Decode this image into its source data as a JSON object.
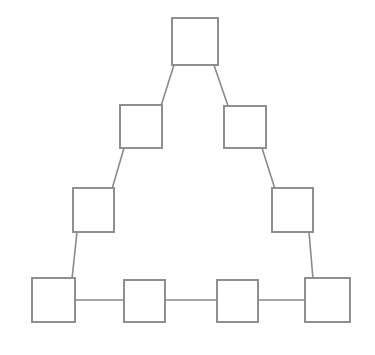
{
  "diagram": {
    "shape_kind": "square",
    "node_count": 9,
    "edge_count": 8,
    "background_color": "#ffffff",
    "stroke_color": "#8a8a8a",
    "node_fill_color": "#ffffff",
    "node_stroke_width": 1.9,
    "edge_stroke_width": 1.6,
    "canvas": {
      "width": 375,
      "height": 355
    },
    "nodes": [
      {
        "id": "apex",
        "label": "",
        "role": "apex",
        "x": 172,
        "y": 18,
        "w": 46,
        "h": 47
      },
      {
        "id": "upper-left",
        "label": "",
        "role": "upper-flank",
        "x": 120,
        "y": 105,
        "w": 42,
        "h": 43
      },
      {
        "id": "upper-right",
        "label": "",
        "role": "upper-flank",
        "x": 224,
        "y": 106,
        "w": 42,
        "h": 42
      },
      {
        "id": "mid-left",
        "label": "",
        "role": "mid-flank",
        "x": 73,
        "y": 188,
        "w": 41,
        "h": 44
      },
      {
        "id": "mid-right",
        "label": "",
        "role": "mid-flank",
        "x": 272,
        "y": 188,
        "w": 41,
        "h": 44
      },
      {
        "id": "bottom-1",
        "label": "",
        "role": "base-corner",
        "x": 32,
        "y": 278,
        "w": 43,
        "h": 44
      },
      {
        "id": "bottom-2",
        "label": "",
        "role": "base-interior",
        "x": 124,
        "y": 280,
        "w": 41,
        "h": 42
      },
      {
        "id": "bottom-3",
        "label": "",
        "role": "base-interior",
        "x": 217,
        "y": 280,
        "w": 41,
        "h": 42
      },
      {
        "id": "bottom-4",
        "label": "",
        "role": "base-corner",
        "x": 305,
        "y": 278,
        "w": 45,
        "h": 44
      }
    ],
    "edges": [
      {
        "id": "edge-apex-upper-left",
        "from": "apex",
        "to": "upper-left",
        "kind": "diagonal",
        "x1": 174,
        "y1": 65,
        "x2": 161,
        "y2": 106
      },
      {
        "id": "edge-apex-upper-right",
        "from": "apex",
        "to": "upper-right",
        "kind": "diagonal",
        "x1": 214,
        "y1": 65,
        "x2": 228,
        "y2": 106
      },
      {
        "id": "edge-upper-left-mid-left",
        "from": "upper-left",
        "to": "mid-left",
        "kind": "diagonal",
        "x1": 124,
        "y1": 148,
        "x2": 112,
        "y2": 189
      },
      {
        "id": "edge-upper-right-mid-right",
        "from": "upper-right",
        "to": "mid-right",
        "kind": "diagonal",
        "x1": 262,
        "y1": 148,
        "x2": 275,
        "y2": 189
      },
      {
        "id": "edge-mid-left-bottom-1",
        "from": "mid-left",
        "to": "bottom-1",
        "kind": "diagonal",
        "x1": 77,
        "y1": 232,
        "x2": 72,
        "y2": 279
      },
      {
        "id": "edge-mid-right-bottom-4",
        "from": "mid-right",
        "to": "bottom-4",
        "kind": "diagonal",
        "x1": 309,
        "y1": 232,
        "x2": 313,
        "y2": 279
      },
      {
        "id": "edge-bottom-1-bottom-2",
        "from": "bottom-1",
        "to": "bottom-2",
        "kind": "horizontal",
        "x1": 75,
        "y1": 300,
        "x2": 124,
        "y2": 300
      },
      {
        "id": "edge-bottom-2-bottom-3",
        "from": "bottom-2",
        "to": "bottom-3",
        "kind": "horizontal",
        "x1": 165,
        "y1": 300,
        "x2": 217,
        "y2": 300
      },
      {
        "id": "edge-bottom-3-bottom-4",
        "from": "bottom-3",
        "to": "bottom-4",
        "kind": "horizontal",
        "x1": 258,
        "y1": 300,
        "x2": 305,
        "y2": 300
      }
    ]
  }
}
